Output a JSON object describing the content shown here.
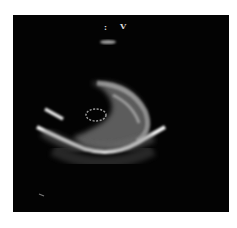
{
  "image": {
    "type": "echocardiogram",
    "view": "short-axis",
    "background": "#ffffff",
    "frame_color": "#030303",
    "markers": {
      "top_marker": "V",
      "small_marker": ":"
    }
  }
}
